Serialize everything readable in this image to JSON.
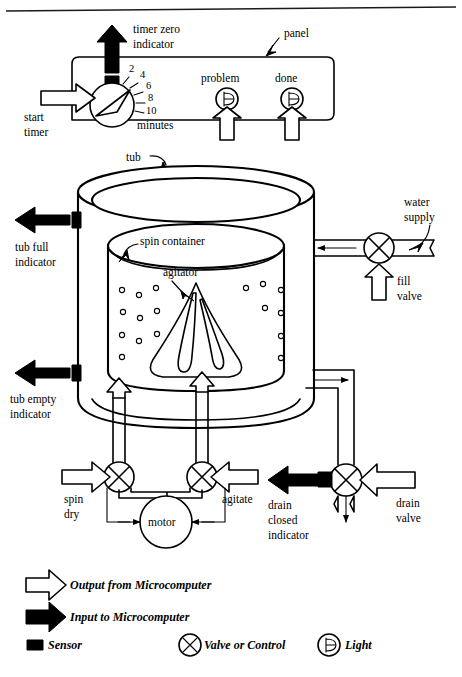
{
  "figure": {
    "top_rule": true
  },
  "panel": {
    "label": "panel",
    "timer": {
      "zero_indicator_label_line1": "timer zero",
      "zero_indicator_label_line2": "indicator",
      "start_label_line1": "start",
      "start_label_line2": "timer",
      "units_label": "minutes",
      "dial_ticks": [
        "2",
        "4",
        "6",
        "8",
        "10"
      ],
      "sensor_name": "timer-zero-sensor"
    },
    "lights": [
      {
        "label": "problem"
      },
      {
        "label": "done"
      }
    ]
  },
  "tub": {
    "label": "tub",
    "spin_container_label": "spin container",
    "agitator_label": "agitator",
    "full_indicator_line1": "tub full",
    "full_indicator_line2": "indicator",
    "empty_indicator_line1": "tub empty",
    "empty_indicator_line2": "indicator"
  },
  "water": {
    "supply_label_line1": "water",
    "supply_label_line2": "supply",
    "fill_valve_line1": "fill",
    "fill_valve_line2": "valve"
  },
  "drain": {
    "valve_line1": "drain",
    "valve_line2": "valve",
    "closed_indicator_line1": "drain",
    "closed_indicator_line2": "closed",
    "closed_indicator_line3": "indicator"
  },
  "drive": {
    "spin_dry_line1": "spin",
    "spin_dry_line2": "dry",
    "agitate_label": "agitate",
    "motor_label": "motor"
  },
  "legend": {
    "items": [
      {
        "key": "output",
        "label": "Output from Microcomputer",
        "symbol": "hollow-arrow"
      },
      {
        "key": "input",
        "label": "Input to Microcomputer",
        "symbol": "filled-arrow"
      },
      {
        "key": "sensor",
        "label": "Sensor",
        "symbol": "filled-square"
      },
      {
        "key": "valve",
        "label": "Valve or Control",
        "symbol": "circle-x"
      },
      {
        "key": "light",
        "label": "Light",
        "symbol": "circle-loop"
      }
    ]
  },
  "colors": {
    "ink": "#000000",
    "paper": "#ffffff"
  }
}
